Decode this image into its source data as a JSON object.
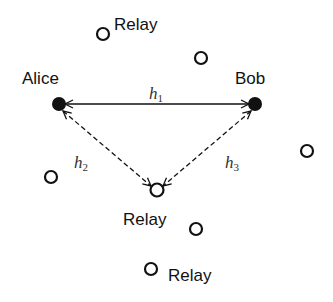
{
  "diagram": {
    "nodes": {
      "alice": {
        "label": "Alice",
        "type": "filled"
      },
      "bob": {
        "label": "Bob",
        "type": "filled"
      },
      "relay_top": {
        "label": "Relay",
        "type": "hollow"
      },
      "relay_center": {
        "label": "Relay",
        "type": "hollow"
      },
      "relay_bottom": {
        "label": "Relay",
        "type": "hollow"
      }
    },
    "edges": {
      "h1": {
        "symbol": "h",
        "subscript": "1",
        "style": "solid",
        "from": "Alice",
        "to": "Bob",
        "bidirectional": true
      },
      "h2": {
        "symbol": "h",
        "subscript": "2",
        "style": "dashed",
        "from": "Alice",
        "to": "Relay",
        "bidirectional": true
      },
      "h3": {
        "symbol": "h",
        "subscript": "3",
        "style": "dashed",
        "from": "Bob",
        "to": "Relay",
        "bidirectional": true
      }
    },
    "unlabeled_relay_count": 4
  }
}
